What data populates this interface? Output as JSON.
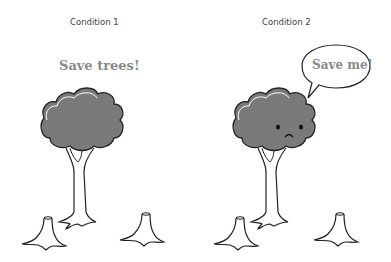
{
  "panels": [
    {
      "label": "Condition 1",
      "message": "Save trees!",
      "message_style": "headline",
      "tree_face": "none"
    },
    {
      "label": "Condition 2",
      "message": "Save me!",
      "message_style": "speech-bubble",
      "tree_face": "sad"
    }
  ],
  "colors": {
    "foliage": "#7a7a7a",
    "outline": "#222222",
    "message_text": "#8a8a8a"
  }
}
